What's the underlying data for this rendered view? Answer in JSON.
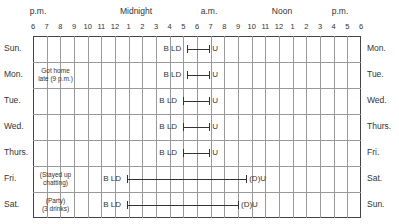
{
  "chart_data": {
    "type": "table",
    "periods": [
      "p.m.",
      "Midnight",
      "a.m.",
      "Noon",
      "p.m."
    ],
    "hour_ticks": [
      "6",
      "7",
      "8",
      "9",
      "10",
      "11",
      "12",
      "1",
      "2",
      "3",
      "4",
      "5",
      "6",
      "7",
      "8",
      "9",
      "10",
      "11",
      "12",
      "1",
      "2",
      "3",
      "4",
      "5",
      "6"
    ],
    "left_days": [
      "Sun.",
      "Mon.",
      "Tue.",
      "Wed.",
      "Thurs.",
      "Fri.",
      "Sat."
    ],
    "right_days": [
      "Mon.",
      "Tue.",
      "Wed.",
      "Thurs.",
      "Fri.",
      "Sat.",
      "Sun."
    ],
    "legend_markers": {
      "B": "bed",
      "L": "lights out",
      "D": "drowsy",
      "U": "up"
    },
    "rows": [
      {
        "day": "Sun.",
        "next": "Mon.",
        "note": "",
        "start_label": "B LD",
        "end_label": "U",
        "sleep_start_h": 11.3,
        "sleep_end_h": 12.9
      },
      {
        "day": "Mon.",
        "next": "Tue.",
        "note": "Got home late (9 p.m.)",
        "start_label": "B LD",
        "end_label": "U",
        "sleep_start_h": 11.3,
        "sleep_end_h": 12.9
      },
      {
        "day": "Tue.",
        "next": "Wed.",
        "note": "",
        "start_label": "B LD",
        "end_label": "U",
        "sleep_start_h": 11.0,
        "sleep_end_h": 12.9
      },
      {
        "day": "Wed.",
        "next": "Thurs.",
        "note": "",
        "start_label": "B LD",
        "end_label": "U",
        "sleep_start_h": 11.0,
        "sleep_end_h": 12.9
      },
      {
        "day": "Thurs.",
        "next": "Fri.",
        "note": "",
        "start_label": "B LD",
        "end_label": "U",
        "sleep_start_h": 11.0,
        "sleep_end_h": 12.9
      },
      {
        "day": "Fri.",
        "next": "Sat.",
        "note": "(Stayed up chatting)",
        "start_label": "B LD",
        "end_label": "(D)U",
        "sleep_start_h": 6.9,
        "sleep_end_h": 15.6
      },
      {
        "day": "Sat.",
        "next": "Sun.",
        "note": "(Party) (3 drinks)",
        "start_label": "B LD",
        "end_label": "(D)U",
        "sleep_start_h": 6.9,
        "sleep_end_h": 15.0
      }
    ],
    "xlabel": "Time of day (6 p.m. to 6 p.m.)",
    "ylabel": "Day",
    "grid": true
  },
  "header": {
    "periods": [
      {
        "label": "p.m.",
        "x": 38
      },
      {
        "label": "Midnight",
        "x": 136
      },
      {
        "label": "a.m.",
        "x": 209
      },
      {
        "label": "Noon",
        "x": 282
      },
      {
        "label": "p.m.",
        "x": 340
      }
    ]
  },
  "notes": {
    "mon": [
      "Got home",
      "late (9 p.m.)"
    ],
    "fri": [
      "(Stayed up",
      "chatting)"
    ],
    "sat": [
      "(Party)",
      "(3 drinks)"
    ]
  }
}
